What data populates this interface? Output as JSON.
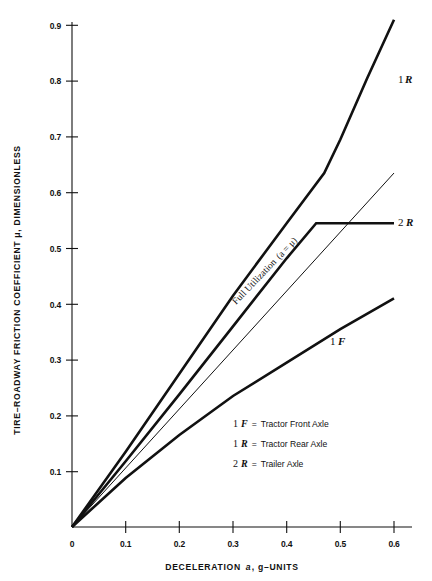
{
  "chart_data": {
    "type": "line",
    "title": "",
    "xlabel": "DECELERATION a, g-UNITS",
    "ylabel": "TIRE-ROADWAY FRICTION COEFFICIENT μ, DIMENSIONLESS",
    "xlim": [
      0,
      0.62
    ],
    "ylim": [
      0,
      0.945
    ],
    "grid": false,
    "legend_position": "inside-lower-right",
    "xticks": [
      "0",
      "0.1",
      "0.2",
      "0.3",
      "0.4",
      "0.5",
      "0.6"
    ],
    "xtick_values": [
      0,
      0.1,
      0.2,
      0.3,
      0.4,
      0.5,
      0.6
    ],
    "yticks": [
      "0.1",
      "0.2",
      "0.3",
      "0.4",
      "0.5",
      "0.6",
      "0.7",
      "0.8",
      "0.9"
    ],
    "ytick_values": [
      0.1,
      0.2,
      0.3,
      0.4,
      0.5,
      0.6,
      0.7,
      0.8,
      0.9
    ],
    "series": [
      {
        "name": "1 R",
        "label": "1 R",
        "label_number": "1",
        "label_letter": "R",
        "style": "thick",
        "x": [
          0,
          0.1,
          0.2,
          0.3,
          0.4,
          0.47,
          0.5,
          0.55,
          0.6
        ],
        "values": [
          0,
          0.135,
          0.275,
          0.415,
          0.545,
          0.635,
          0.695,
          0.805,
          0.91
        ]
      },
      {
        "name": "2 R",
        "label": "2 R",
        "label_number": "2",
        "label_letter": "R",
        "style": "thick",
        "x": [
          0,
          0.1,
          0.2,
          0.3,
          0.4,
          0.455,
          0.47,
          0.6
        ],
        "values": [
          0,
          0.118,
          0.238,
          0.36,
          0.482,
          0.545,
          0.545,
          0.545
        ]
      },
      {
        "name": "1 F",
        "label": "1 F",
        "label_number": "1",
        "label_letter": "F",
        "style": "thick",
        "x": [
          0,
          0.1,
          0.2,
          0.3,
          0.4,
          0.5,
          0.6
        ],
        "values": [
          0,
          0.088,
          0.165,
          0.235,
          0.295,
          0.355,
          0.41
        ]
      },
      {
        "name": "Full Utilization",
        "label": "Full Utilization (a = μ)",
        "style": "thin",
        "x": [
          0,
          0.6
        ],
        "values": [
          0,
          0.635
        ]
      }
    ],
    "annotations": [
      {
        "name": "full-utilization",
        "text_main": "Full Utilization",
        "text_paren": "(a = μ)",
        "text_full": "Full Utilization (a = μ)",
        "x": 0.33,
        "y": 0.35,
        "rotation": -46
      }
    ]
  },
  "legend": {
    "items": [
      {
        "code_number": "1",
        "code_letter": "F",
        "equals": "=",
        "label": "Tractor Front Axle"
      },
      {
        "code_number": "1",
        "code_letter": "R",
        "equals": "=",
        "label": "Tractor Rear Axle"
      },
      {
        "code_number": "2",
        "code_letter": "R",
        "equals": "=",
        "label": "Trailer Axle"
      }
    ]
  },
  "axes": {
    "x_title_main": "DECELERATION",
    "x_title_var": "a",
    "x_title_units": ", g–UNITS",
    "y_title": "TIRE–ROADWAY FRICTION COEFFICIENT  μ, DIMENSIONLESS"
  },
  "colors": {
    "ink": "#111111",
    "background": "#ffffff"
  }
}
